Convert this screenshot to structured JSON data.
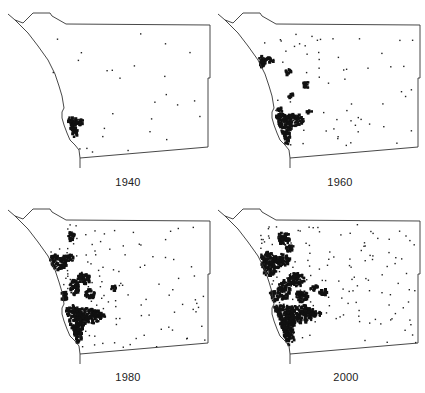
{
  "figure": {
    "panels": [
      {
        "year_label": "1940",
        "density": "sparse"
      },
      {
        "year_label": "1960",
        "density": "moderate"
      },
      {
        "year_label": "1980",
        "density": "heavy"
      },
      {
        "year_label": "2000",
        "density": "very-heavy"
      }
    ]
  }
}
